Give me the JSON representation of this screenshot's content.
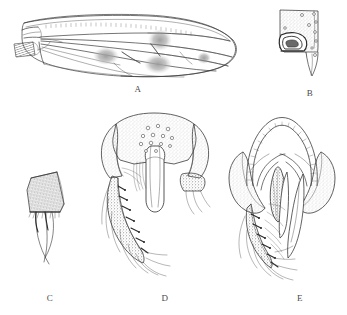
{
  "figure": {
    "kind": "scientific-illustration-plate",
    "discipline": "entomology-morphology",
    "technique": "ink line drawing with stipple and hatch shading",
    "background_color": "#ffffff",
    "ink_color": "#3a3a3a",
    "stipple_color": "#7d7d7d",
    "panel_count": 5,
    "width_px": 347,
    "height_px": 315
  },
  "panels": [
    {
      "id": "A",
      "label": "A",
      "label_x": 138,
      "label_y": 88,
      "subject": "wing",
      "description": "Whole wing, dorsal view, elongate-oval, with costal margin thickened, longitudinal veins and dark stippled clouds over the crossveins; dark hatched alula at wing base.",
      "features": [
        "costa",
        "subcosta",
        "radial veins",
        "medial veins",
        "cubital vein",
        "crossvein clouds",
        "alula",
        "wing membrane"
      ],
      "shaded_patch_count": 4
    },
    {
      "id": "B",
      "label": "B",
      "label_x": 310,
      "label_y": 92,
      "subject": "abdominal sclerite",
      "description": "Tapering sclerite with fine stippling, scattered circular setal sockets and a dark hook-shaped sclerotized process at the lower left margin.",
      "features": [
        "stippled surface",
        "setal sockets",
        "dark hooked process",
        "apical point"
      ],
      "socket_count": 9
    },
    {
      "id": "C",
      "label": "C",
      "label_x": 50,
      "label_y": 299,
      "subject": "hairy plate",
      "description": "Trapezoidal plate densely covered with fine short hairs, bearing three long curved crossing setae at the lower margin.",
      "features": [
        "dense pilosity",
        "long curved setae"
      ],
      "long_seta_count": 3
    },
    {
      "id": "D",
      "label": "D",
      "label_x": 165,
      "label_y": 299,
      "subject": "male terminalia, dorsal view",
      "description": "Epandrium broad with flaring lateral lobes, finely stippled, with a cluster of circular setal sockets medially; median tongue-like phallic process projecting downward; elongate setose gonostylus on the left bearing a row of stout spine-like setae.",
      "features": [
        "epandrium",
        "lateral lobes",
        "setal socket cluster",
        "median phallic process",
        "gonostylus",
        "stout setae"
      ],
      "socket_cluster_count": 13
    },
    {
      "id": "E",
      "label": "E",
      "label_x": 300,
      "label_y": 299,
      "subject": "male terminalia, ventral view",
      "description": "Ventral aspect showing an arched transversely striated hypandrial bridge over paired stippled lateral lobes, a median dark lanceolate sclerite, two elongate blade-like surstyli, and the setose gonostylus on the left.",
      "features": [
        "striated arch",
        "lateral stippled lobes",
        "median dark sclerite",
        "paired blade-like lobes",
        "gonostylus",
        "stout setae"
      ]
    }
  ]
}
